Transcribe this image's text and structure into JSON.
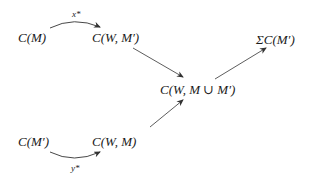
{
  "diagram": {
    "type": "commutative-diagram",
    "nodes": [
      {
        "id": "cm",
        "label": "C(M)"
      },
      {
        "id": "cwm_prime",
        "label": "C(W, M′)"
      },
      {
        "id": "sigma_cm_prime",
        "label": "ΣC(M′)"
      },
      {
        "id": "cw_union",
        "label": "C(W, M ∪ M′)"
      },
      {
        "id": "cm_prime",
        "label": "C(M′)"
      },
      {
        "id": "cwm",
        "label": "C(W, M)"
      }
    ],
    "edges": [
      {
        "from": "cm",
        "to": "cwm_prime",
        "label": "x*",
        "style": "curved-arrow-above"
      },
      {
        "from": "cm_prime",
        "to": "cwm",
        "label": "y*",
        "style": "curved-arrow-below"
      },
      {
        "from": "cwm_prime",
        "to": "cw_union",
        "label": "",
        "style": "straight-arrow"
      },
      {
        "from": "cwm",
        "to": "cw_union",
        "label": "",
        "style": "straight-arrow"
      },
      {
        "from": "cw_union",
        "to": "sigma_cm_prime",
        "label": "",
        "style": "straight-arrow"
      }
    ],
    "edge_labels": {
      "x_star": "x*",
      "y_star": "y*"
    }
  }
}
